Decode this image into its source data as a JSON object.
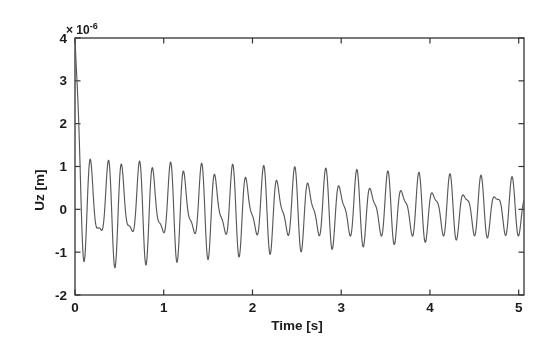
{
  "figure": {
    "background_color": "#ffffff",
    "axis_color": "#333333",
    "line_color": "#585858",
    "text_color": "#1b1b1b"
  },
  "chart_data": {
    "type": "line",
    "title": "",
    "xlabel": "Time [s]",
    "ylabel": "Uz [m]",
    "y_scale_exponent": {
      "prefix": "× 10",
      "power": "-6"
    },
    "units_scale": "1e-6 m",
    "xlim": [
      0,
      5.06
    ],
    "ylim": [
      -2,
      4
    ],
    "xticks": {
      "values": [
        0,
        1,
        2,
        3,
        4,
        5
      ],
      "labels": [
        "0",
        "1",
        "2",
        "3",
        "4",
        "5"
      ]
    },
    "yticks": {
      "values": [
        4,
        3,
        2,
        1,
        0,
        -1,
        -2
      ],
      "labels": [
        "4",
        "3",
        "2",
        "1",
        "0",
        "-1",
        "-2"
      ]
    },
    "grid": false,
    "box": true,
    "legend": null,
    "series": [
      {
        "name": "Uz displacement response",
        "model": {
          "formula": "u(t) = spike.A*exp(-spike.k*t) + env.A*exp(-env.k*t) * sum_i modes[i].A*sin(2*pi*modes[i].f*t + modes[i].phase)  [u in 1e-6 m]",
          "spike": {
            "A": 3.5,
            "k": 28
          },
          "env": {
            "A": 1.0,
            "k": 0.13
          },
          "modes": [
            {
              "A": 0.95,
              "f": 5.7,
              "phase": 1.131
            },
            {
              "A": 0.5,
              "f": 8.6,
              "phase": 5.59
            }
          ],
          "dt": 0.004
        },
        "visible_features": {
          "initial_value": 4.0,
          "first_trough": {
            "t": 0.1,
            "u": -1.25
          },
          "early_peak_amplitude": 1.45,
          "peak_amplitude_at_t2": 1.1,
          "late_peak_amplitude_at_t5": 0.72
        }
      }
    ]
  }
}
